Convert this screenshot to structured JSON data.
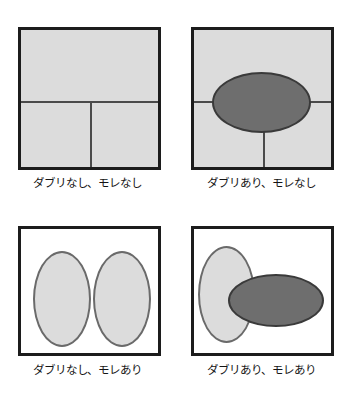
{
  "figure": {
    "background_color": "#ffffff",
    "panel_border_color": "#1c1c1c",
    "fill_gray": "#dcdcdc",
    "accent_gray": "#6e6e6e"
  },
  "panels": [
    {
      "id": "no-overlap-no-gap",
      "caption": "ダブリなし、モレなし",
      "frame": "filled",
      "dividers": [
        "horizontal",
        "vertical-lower"
      ],
      "shapes": []
    },
    {
      "id": "overlap-no-gap",
      "caption": "ダブリあり、モレなし",
      "frame": "filled",
      "dividers": [
        "horizontal",
        "vertical-lower"
      ],
      "shapes": [
        "dark-horizontal-ellipse"
      ]
    },
    {
      "id": "no-overlap-gap",
      "caption": "ダブリなし、モレあり",
      "frame": "empty",
      "dividers": [],
      "shapes": [
        "light-vertical-ellipse-left",
        "light-vertical-ellipse-right"
      ]
    },
    {
      "id": "overlap-gap",
      "caption": "ダブリあり、モレあり",
      "frame": "empty",
      "dividers": [],
      "shapes": [
        "light-vertical-ellipse",
        "dark-horizontal-ellipse"
      ]
    }
  ]
}
